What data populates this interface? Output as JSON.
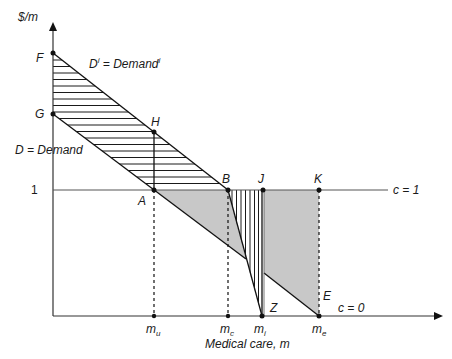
{
  "diagram": {
    "y_axis_label": "$/m",
    "x_axis_label": "Medical care, m",
    "y_tick": "1",
    "curves": {
      "insured_demand": {
        "name": "D",
        "sup": "i",
        "eq": " = Demand",
        "sup2": "i"
      },
      "demand": {
        "label": "D = Demand"
      }
    },
    "lines": {
      "c1": "c = 1",
      "c0": "c = 0"
    },
    "points": {
      "F": "F",
      "G": "G",
      "H": "H",
      "A": "A",
      "B": "B",
      "J": "J",
      "K": "K",
      "Z": "Z",
      "E": "E"
    },
    "x_ticks": [
      {
        "base": "m",
        "sub": "u"
      },
      {
        "base": "m",
        "sub": "c"
      },
      {
        "base": "m",
        "sub": "i"
      },
      {
        "base": "m",
        "sub": "e"
      }
    ],
    "colors": {
      "axis": "#333333",
      "line": "#1a1a1a",
      "shade": "#c8c8c8",
      "guide": "#999999"
    }
  }
}
